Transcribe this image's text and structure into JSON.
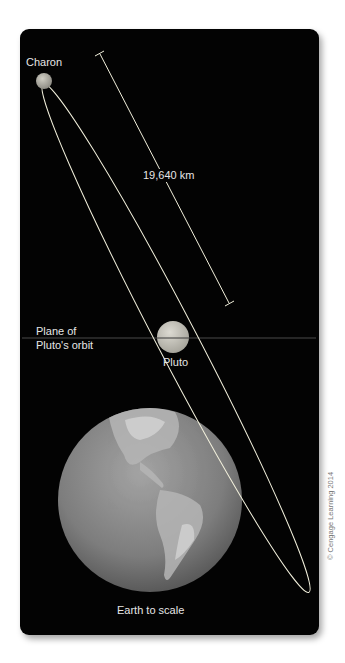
{
  "diagram": {
    "labels": {
      "charon": "Charon",
      "distance": "19,640 km",
      "plane_line1": "Plane of",
      "plane_line2": "Pluto's orbit",
      "pluto": "Pluto",
      "earth": "Earth to scale",
      "copyright": "© Cengage Learning 2014"
    },
    "colors": {
      "background": "#030303",
      "orbit": "#f2f0dc",
      "text": "#e6e6e6",
      "pluto": "#c8c6bd",
      "charon": "#b9b7ad",
      "earth": "#8a8a8a"
    },
    "measurements": {
      "charon_pluto_distance_km": 19640
    }
  }
}
